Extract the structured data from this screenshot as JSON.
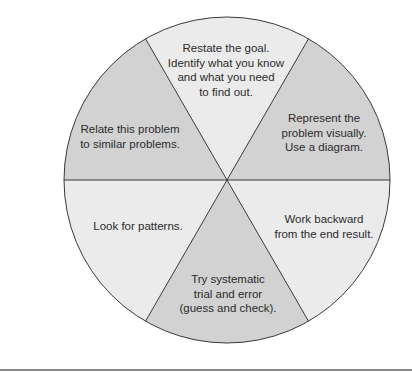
{
  "diagram": {
    "type": "wheel",
    "segments": [
      {
        "id": "top",
        "shade": "light",
        "lines": [
          "Restate the goal.",
          "Identify what you know",
          "and what you need",
          "to find out."
        ]
      },
      {
        "id": "top-right",
        "shade": "dark",
        "lines": [
          "Represent the",
          "problem visually.",
          "Use a diagram."
        ]
      },
      {
        "id": "bottom-right",
        "shade": "light",
        "lines": [
          "Work backward",
          "from the end result."
        ]
      },
      {
        "id": "bottom",
        "shade": "dark",
        "lines": [
          "Try systematic",
          "trial and error",
          "(guess and check)."
        ]
      },
      {
        "id": "bottom-left",
        "shade": "light",
        "lines": [
          "Look for patterns."
        ]
      },
      {
        "id": "top-left",
        "shade": "dark",
        "lines": [
          "Relate this problem",
          "to similar problems."
        ]
      }
    ],
    "colors": {
      "dark": "#d2d2d2",
      "light": "#ebebeb",
      "stroke": "#3a3a3a",
      "rule": "#8a8a8a"
    }
  }
}
